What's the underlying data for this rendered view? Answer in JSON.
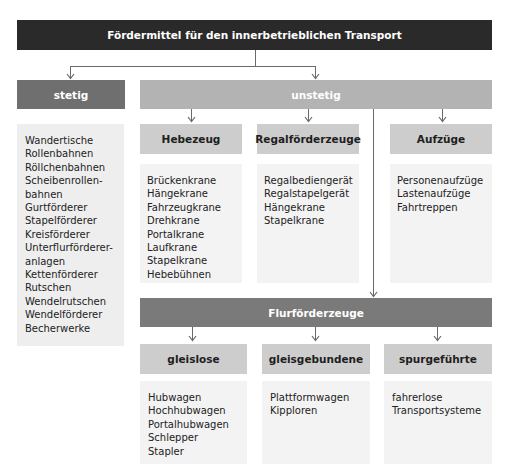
{
  "title": "Fördermittel für den innerbetrieblichen Transport",
  "stetig": {
    "label": "stetig",
    "items": [
      "Wandertische",
      "Rollenbahnen",
      "Röllchenbahnen",
      "Scheibenrollen-",
      "bahnen",
      "Gurtförderer",
      "Stapelförderer",
      "Kreisförderer",
      "Unterflurförderer-",
      "anlagen",
      "Kettenförderer",
      "Rutschen",
      "Wendelrutschen",
      "Wendelförderer",
      "Becherwerke"
    ]
  },
  "unstetig": {
    "label": "unstetig",
    "groups": [
      {
        "label": "Hebezeug",
        "items": [
          "Brückenkrane",
          "Hängekrane",
          "Fahrzeugkrane",
          "Drehkrane",
          "Portalkrane",
          "Laufkrane",
          "Stapelkrane",
          "Hebebühnen"
        ]
      },
      {
        "label": "Regalförderzeuge",
        "items": [
          "Regalbediengerät",
          "Regalstapelgerät",
          "Hängekrane",
          "Stapelkrane"
        ]
      },
      {
        "label": "Aufzüge",
        "items": [
          "Personenaufzüge",
          "Lastenaufzüge",
          "Fahrtreppen"
        ]
      }
    ]
  },
  "flurfoerderzeuge": {
    "label": "Flurförderzeuge",
    "groups": [
      {
        "label": "gleislose",
        "items": [
          "Hubwagen",
          "Hochhubwagen",
          "Portalhubwagen",
          "Schlepper",
          "Stapler"
        ]
      },
      {
        "label": "gleisgebundene",
        "items": [
          "Plattformwagen",
          "Kipploren"
        ]
      },
      {
        "label": "spurgeführte",
        "items": [
          "fahrerlose",
          "Transportsysteme"
        ]
      }
    ]
  },
  "colors": {
    "title_bg": "#2a2a2a",
    "stetig_bg": "#6f6f6f",
    "unstetig_bg": "#b3b3b3",
    "flur_bg": "#7a7a7a",
    "subheader_bg": "#cdcdcd",
    "list_bg": "#eeeeee",
    "connector": "#6a6a6a"
  }
}
